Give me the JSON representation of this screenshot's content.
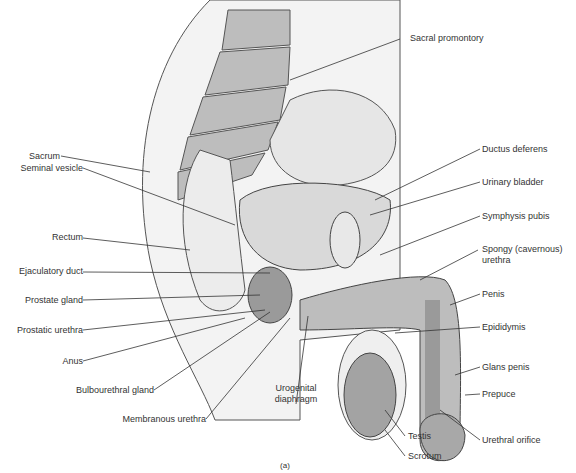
{
  "figure": {
    "caption": "(a)"
  },
  "labels_left": [
    {
      "id": "sacrum",
      "text": "Sacrum"
    },
    {
      "id": "seminal-vesicle",
      "text": "Seminal vesicle"
    },
    {
      "id": "rectum",
      "text": "Rectum"
    },
    {
      "id": "ejaculatory-duct",
      "text": "Ejaculatory duct"
    },
    {
      "id": "prostate-gland",
      "text": "Prostate gland"
    },
    {
      "id": "prostatic-urethra",
      "text": "Prostatic urethra"
    },
    {
      "id": "anus",
      "text": "Anus"
    },
    {
      "id": "bulbourethral-gland",
      "text": "Bulbourethral gland"
    },
    {
      "id": "membranous-urethra",
      "text": "Membranous urethra"
    }
  ],
  "labels_right": [
    {
      "id": "sacral-promontory",
      "text": "Sacral promontory"
    },
    {
      "id": "ductus-deferens",
      "text": "Ductus deferens"
    },
    {
      "id": "urinary-bladder",
      "text": "Urinary bladder"
    },
    {
      "id": "symphysis-pubis",
      "text": "Symphysis pubis"
    },
    {
      "id": "spongy-urethra-1",
      "text": "Spongy (cavernous)"
    },
    {
      "id": "spongy-urethra-2",
      "text": "urethra"
    },
    {
      "id": "penis",
      "text": "Penis"
    },
    {
      "id": "epididymis",
      "text": "Epididymis"
    },
    {
      "id": "glans-penis",
      "text": "Glans penis"
    },
    {
      "id": "prepuce",
      "text": "Prepuce"
    },
    {
      "id": "urethral-orifice",
      "text": "Urethral orifice"
    }
  ],
  "labels_bottom": [
    {
      "id": "urogenital-1",
      "text": "Urogenital"
    },
    {
      "id": "urogenital-2",
      "text": "diaphragm"
    },
    {
      "id": "testis",
      "text": "Testis"
    },
    {
      "id": "scrotum",
      "text": "Scrotum"
    }
  ],
  "colors": {
    "tissue_light": "#e6e6e6",
    "tissue_mid": "#bdbdbd",
    "tissue_dark": "#9a9a9a",
    "line": "#333333"
  }
}
